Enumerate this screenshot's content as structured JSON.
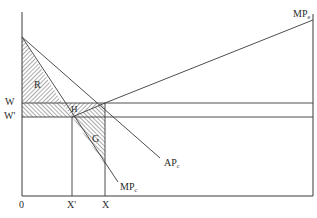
{
  "diagram": {
    "type": "economics-labor-market",
    "axis_labels": {
      "origin": "0",
      "w": "W",
      "w_prime": "W'",
      "x_prime": "X'",
      "x": "X"
    },
    "curves": [
      {
        "id": "mp_e",
        "label": "MP",
        "sub": "e"
      },
      {
        "id": "ap_c",
        "label": "AP",
        "sub": "c"
      },
      {
        "id": "mp_c",
        "label": "MP",
        "sub": "c"
      }
    ],
    "regions": [
      {
        "id": "R",
        "label": "R"
      },
      {
        "id": "H",
        "label": "H"
      },
      {
        "id": "G",
        "label": "G"
      }
    ],
    "colors": {
      "line": "#3a3a3a",
      "hatch": "#444444",
      "background": "#ffffff"
    }
  }
}
